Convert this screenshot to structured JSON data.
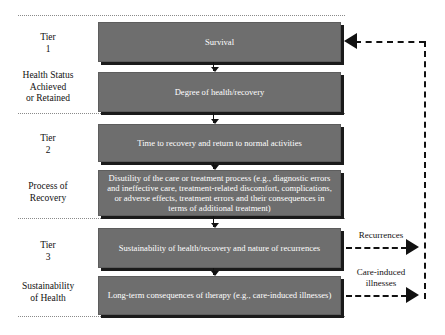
{
  "diagram": {
    "box_fill_color": "#6e6e6e",
    "box_text_color": "#ffffff",
    "line_color": "#111111",
    "separator_color": "#8a8a8a",
    "tiers": [
      {
        "tier_label_line1": "Tier",
        "tier_label_line2": "1",
        "dimension_label": "Health Status\nAchieved\nor Retained",
        "boxes": [
          {
            "text": "Survival"
          },
          {
            "text": "Degree of health/recovery"
          }
        ]
      },
      {
        "tier_label_line1": "Tier",
        "tier_label_line2": "2",
        "dimension_label": "Process of\nRecovery",
        "boxes": [
          {
            "text": "Time to recovery and return to normal activities"
          },
          {
            "text": "Disutility of the care or treatment process (e.g., diagnostic errors and ineffective care, treatment-related discomfort, complications, or adverse effects, treatment errors and their consequences in terms of additional treatment)"
          }
        ]
      },
      {
        "tier_label_line1": "Tier",
        "tier_label_line2": "3",
        "dimension_label": "Sustainability\nof Health",
        "boxes": [
          {
            "text": "Sustainability of health/recovery and nature of recurrences"
          },
          {
            "text": "Long-term consequences of therapy (e.g., care-induced illnesses)"
          }
        ]
      }
    ],
    "labels": {
      "tier1_word": "Tier",
      "tier1_num": "1",
      "tier1_dim_l1": "Health Status",
      "tier1_dim_l2": "Achieved",
      "tier1_dim_l3": "or Retained",
      "tier2_word": "Tier",
      "tier2_num": "2",
      "tier2_dim_l1": "Process of",
      "tier2_dim_l2": "Recovery",
      "tier3_word": "Tier",
      "tier3_num": "3",
      "tier3_dim_l1": "Sustainability",
      "tier3_dim_l2": "of Health"
    },
    "box_texts": {
      "survival": "Survival",
      "degree_health": "Degree of health/recovery",
      "time_recovery": "Time to recovery and return to normal activities",
      "disutility": "Disutility of the care or treatment process (e.g., diagnostic errors and ineffective care, treatment-related discomfort, complications, or adverse effects, treatment errors and their consequences in terms of additional treatment)",
      "sustainability": "Sustainability of health/recovery and nature of recurrences",
      "long_term": "Long-term consequences of therapy (e.g., care-induced illnesses)"
    },
    "feedback_arrows": [
      {
        "label": "Recurrences",
        "direction": "right"
      },
      {
        "label": "Care-induced illnesses",
        "direction": "right"
      }
    ],
    "out_labels": {
      "recurrences": "Recurrences",
      "care_induced_l1": "Care-induced",
      "care_induced_l2": "illnesses"
    }
  }
}
